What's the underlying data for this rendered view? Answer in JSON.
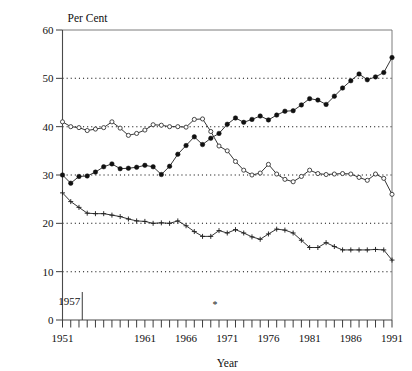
{
  "chart_data": {
    "type": "line",
    "title": "",
    "xlabel": "Year",
    "ylabel": "Per Cent",
    "xlim": [
      1951,
      1991
    ],
    "ylim": [
      0,
      60
    ],
    "grid": true,
    "grid_values": [
      10,
      20,
      30,
      40,
      50
    ],
    "legend": "none",
    "y_ticks": [
      0,
      10,
      20,
      30,
      40,
      50,
      60
    ],
    "y_tick_labels": [
      "0",
      "10",
      "20",
      "30",
      "40",
      "50",
      "60"
    ],
    "x_ticks": [
      1951,
      1952,
      1953,
      1954,
      1955,
      1956,
      1957,
      1958,
      1959,
      1960,
      1961,
      1962,
      1963,
      1964,
      1965,
      1966,
      1967,
      1968,
      1969,
      1970,
      1971,
      1972,
      1973,
      1974,
      1975,
      1976,
      1977,
      1978,
      1979,
      1980,
      1981,
      1982,
      1983,
      1984,
      1985,
      1986,
      1987,
      1988,
      1989,
      1990,
      1991
    ],
    "x_tick_labels": [
      "1951",
      "1961",
      "1966",
      "1971",
      "1976",
      "1981",
      "1986",
      "1991"
    ],
    "x_tick_label_values": [
      1951,
      1961,
      1966,
      1971,
      1976,
      1981,
      1986,
      1991
    ],
    "x": [
      1951,
      1952,
      1953,
      1954,
      1955,
      1956,
      1957,
      1958,
      1959,
      1960,
      1961,
      1962,
      1963,
      1964,
      1965,
      1966,
      1967,
      1968,
      1969,
      1970,
      1971,
      1972,
      1973,
      1974,
      1975,
      1976,
      1977,
      1978,
      1979,
      1980,
      1981,
      1982,
      1983,
      1984,
      1985,
      1986,
      1987,
      1988,
      1989,
      1990,
      1991
    ],
    "series": [
      {
        "name": "filled-circle-series",
        "marker": "filled-circle",
        "values": [
          30.0,
          28.3,
          29.7,
          29.8,
          30.6,
          31.7,
          32.3,
          31.3,
          31.4,
          31.6,
          32.0,
          31.7,
          30.1,
          31.8,
          34.3,
          36.1,
          37.9,
          36.3,
          37.6,
          38.6,
          40.5,
          41.8,
          40.9,
          41.5,
          42.2,
          41.4,
          42.4,
          43.2,
          43.3,
          44.5,
          45.8,
          45.5,
          44.6,
          46.3,
          48.0,
          49.5,
          50.9,
          49.7,
          50.3,
          51.2,
          54.3
        ]
      },
      {
        "name": "open-circle-series",
        "marker": "open-circle",
        "values": [
          41.0,
          40.0,
          39.8,
          39.2,
          39.5,
          39.8,
          41.0,
          39.7,
          38.2,
          38.6,
          39.3,
          40.4,
          40.3,
          40.0,
          40.0,
          39.9,
          41.5,
          41.6,
          39.0,
          36.0,
          35.0,
          32.8,
          31.0,
          30.0,
          30.4,
          32.2,
          30.2,
          29.1,
          28.6,
          29.7,
          31.0,
          30.3,
          30.1,
          30.2,
          30.3,
          30.2,
          29.5,
          28.9,
          30.2,
          29.3,
          26.0
        ]
      },
      {
        "name": "plus-marker-series",
        "marker": "plus",
        "values": [
          26.3,
          24.5,
          23.3,
          22.1,
          22.0,
          22.0,
          21.7,
          21.4,
          20.9,
          20.5,
          20.4,
          20.0,
          20.1,
          20.0,
          20.5,
          19.5,
          18.3,
          17.3,
          17.3,
          18.5,
          18.0,
          18.7,
          18.0,
          17.2,
          16.7,
          17.8,
          18.8,
          18.6,
          18.0,
          16.5,
          15.0,
          15.0,
          16.0,
          15.2,
          14.5,
          14.5,
          14.5,
          14.5,
          14.6,
          14.5,
          12.4
        ]
      }
    ],
    "annotations": [
      {
        "name": "year-marker-1957",
        "label": "1957",
        "x": 1953.4,
        "type": "vertical-tick-label"
      },
      {
        "name": "asterisk-marker",
        "label": "*",
        "x": 1969.5,
        "type": "point-symbol"
      }
    ]
  }
}
